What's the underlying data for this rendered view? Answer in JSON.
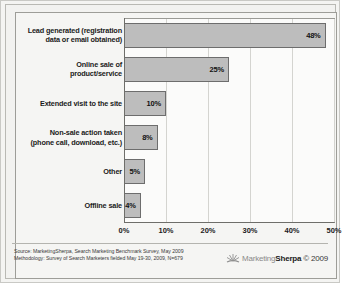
{
  "chart_data": {
    "type": "bar",
    "orientation": "horizontal",
    "title": "",
    "xlabel": "",
    "ylabel": "",
    "xlim": [
      0,
      50
    ],
    "grid": true,
    "legend": "none",
    "categories": [
      "Lead generated (registration data or email obtained)",
      "Online sale of product/service",
      "Extended visit to the site",
      "Non-sale action taken (phone call, download, etc.)",
      "Other",
      "Offline sale"
    ],
    "category_lines": [
      [
        "Lead generated  (registration",
        "data or email obtained)"
      ],
      [
        "Online sale of",
        "product/service"
      ],
      [
        "Extended visit to the site"
      ],
      [
        "Non-sale action taken",
        "(phone call, download, etc.)"
      ],
      [
        "Other"
      ],
      [
        "Offline sale"
      ]
    ],
    "values": [
      48,
      25,
      10,
      8,
      5,
      4
    ],
    "value_labels": [
      "48%",
      "25%",
      "10%",
      "8%",
      "5%",
      "4%"
    ],
    "xticks": [
      "0%",
      "10%",
      "20%",
      "30%",
      "40%",
      "50%"
    ],
    "xtick_values": [
      0,
      10,
      20,
      30,
      40,
      50
    ],
    "bar_color": "#bdbdbd",
    "bar_border_color": "#6d6d6d",
    "plot_background": "#fbfbfa",
    "gridline_color": "#d4d4d0"
  },
  "footer": {
    "source_line_1": "Source: MarketingSherpa, Search Marketing Benchmark Survey, May 2009",
    "source_line_2": "Methodology: Survey of Search Marketers fielded May 19-30, 2009, N=679",
    "brand_part_1": "Marketing",
    "brand_part_2": "Sherpa",
    "brand_copyright": "© 2009",
    "logo_name": "sunburst-logo"
  }
}
